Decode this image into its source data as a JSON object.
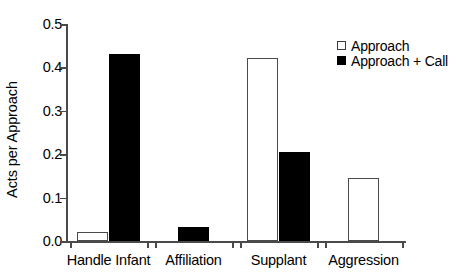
{
  "chart_data": {
    "type": "bar",
    "title": "",
    "xlabel": "",
    "ylabel": "Acts per Approach",
    "categories": [
      "Handle Infant",
      "Affiliation",
      "Supplant",
      "Aggression"
    ],
    "series": [
      {
        "name": "Approach",
        "fill": "open",
        "color": "#ffffff",
        "values": [
          0.021,
          0,
          0.422,
          0.146
        ]
      },
      {
        "name": "Approach + Call",
        "fill": "filled",
        "color": "#000000",
        "values": [
          0.431,
          0.033,
          0.204,
          0
        ]
      }
    ],
    "ylim": [
      0.0,
      0.5
    ],
    "yticks": [
      0.0,
      0.1,
      0.2,
      0.3,
      0.4,
      0.5
    ],
    "ytick_labels": [
      "0.0",
      "0.1",
      "0.2",
      "0.3",
      "0.4",
      "0.5"
    ],
    "grid": false,
    "legend_position": "top-right",
    "legend_entries": [
      "Approach",
      "Approach + Call"
    ],
    "axis_color": "#4a4a4a"
  }
}
